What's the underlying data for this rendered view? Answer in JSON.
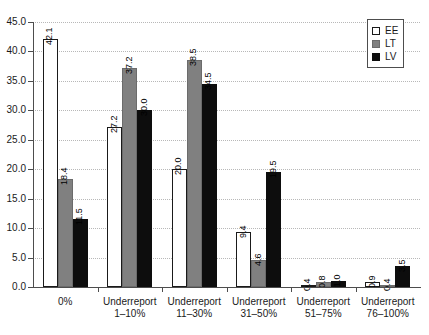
{
  "chart_data": {
    "type": "bar",
    "title": "",
    "subtitle": "",
    "xlabel": "",
    "ylabel": "",
    "ylim": [
      0.0,
      45.0
    ],
    "ytick_labels": [
      "0.0",
      "5.0",
      "10.0",
      "15.0",
      "20.0",
      "25.0",
      "30.0",
      "35.0",
      "40.0",
      "45.0"
    ],
    "ytick_values": [
      0.0,
      5.0,
      10.0,
      15.0,
      20.0,
      25.0,
      30.0,
      35.0,
      40.0,
      45.0
    ],
    "grid": true,
    "grid_axis": "y",
    "legend_position": "top-right",
    "categories": [
      "0%",
      "Underreport 1–10%",
      "Underreport 11–30%",
      "Underreport 31–50%",
      "Underreport 51–75%",
      "Underreport 76–100%"
    ],
    "category_lines": [
      [
        "0%"
      ],
      [
        "Underreport",
        "1–10%"
      ],
      [
        "Underreport",
        "11–30%"
      ],
      [
        "Underreport",
        "31–50%"
      ],
      [
        "Underreport",
        "51–75%"
      ],
      [
        "Underreport",
        "76–100%"
      ]
    ],
    "series": [
      {
        "name": "EE",
        "color": "#ffffff",
        "edge_color": "#1a1a1a",
        "values": [
          42.1,
          27.2,
          20.0,
          9.4,
          0.4,
          0.9
        ],
        "labels": [
          "42.1",
          "27.2",
          "20.0",
          "9.4",
          "0.4",
          "0.9"
        ]
      },
      {
        "name": "LT",
        "color": "#808080",
        "edge_color": "#6b6b6b",
        "values": [
          18.4,
          37.2,
          38.5,
          4.6,
          0.8,
          0.4
        ],
        "labels": [
          "18.4",
          "37.2",
          "38.5",
          "4.6",
          "0.8",
          "0.4"
        ]
      },
      {
        "name": "LV",
        "color": "#0d0d0d",
        "edge_color": "#0d0d0d",
        "values": [
          11.5,
          30.0,
          34.5,
          19.5,
          1.0,
          3.5
        ],
        "labels": [
          "11.5",
          "30.0",
          "34.5",
          "19.5",
          "1.0",
          "3.5"
        ]
      }
    ]
  },
  "legend": {
    "entries": [
      {
        "label": "EE"
      },
      {
        "label": "LT"
      },
      {
        "label": "LV"
      }
    ]
  }
}
